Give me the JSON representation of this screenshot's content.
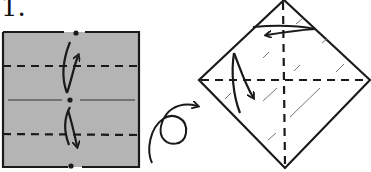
{
  "diagram": {
    "step_number": "1.",
    "colors": {
      "paper_colored_side": "#b4b4b4",
      "paper_white_side": "#ffffff",
      "line": "#1a1a1a"
    },
    "figures": [
      {
        "name": "square-colored-side",
        "shape": "square",
        "fill": "gray",
        "crease_lines": [
          "horizontal-center-thin"
        ],
        "fold_lines": [
          "valley-fold-upper-horizontal",
          "valley-fold-lower-horizontal"
        ],
        "reference_points": [
          "top-center",
          "center",
          "bottom-center"
        ],
        "arrows": [
          "fold-up-to-top",
          "fold-down-to-bottom"
        ]
      },
      {
        "name": "turn-over-symbol",
        "shape": "loop-arrow",
        "meaning": "turn over"
      },
      {
        "name": "diamond-white-side",
        "shape": "diamond",
        "fill": "white",
        "fold_lines": [
          "valley-fold-vertical",
          "valley-fold-horizontal"
        ],
        "arrows": [
          "fold-right-to-left",
          "fold-top-to-bottom"
        ]
      }
    ]
  }
}
